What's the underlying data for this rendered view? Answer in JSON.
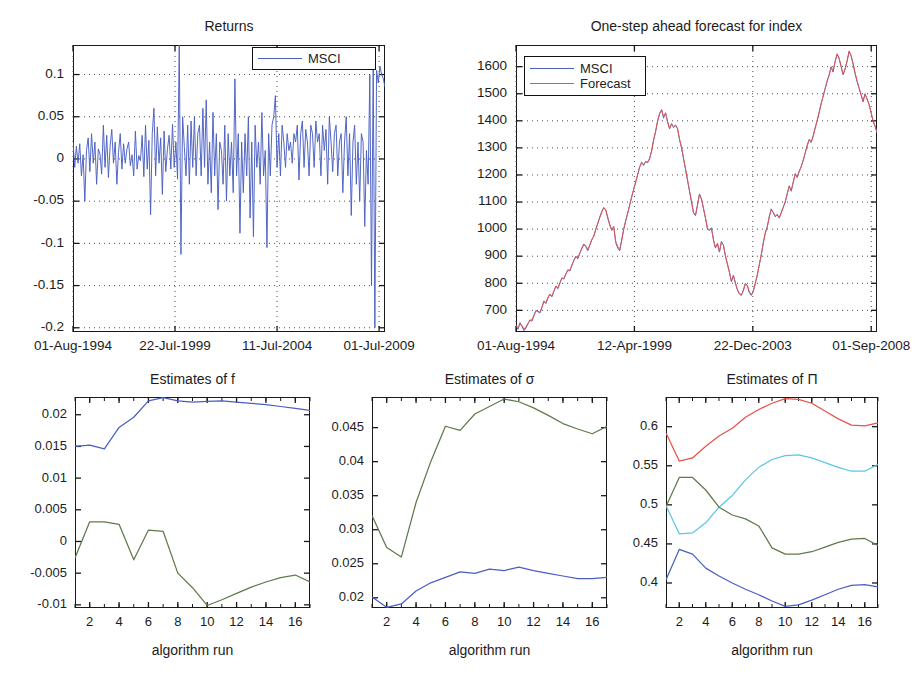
{
  "figure": {
    "background": "#ffffff",
    "colors": {
      "blue": "#4a5fc1",
      "red": "#e8534a",
      "green": "#5e7a4a",
      "cyan": "#58c8e8",
      "axis": "#1a1a1a",
      "grid": "#4d4d4d"
    }
  },
  "chart_data": [
    {
      "id": "returns",
      "type": "line",
      "title": "Returns",
      "xlabel": "",
      "ylabel": "",
      "grid": true,
      "legend": {
        "position": "top-right",
        "entries": [
          {
            "name": "MSCI",
            "color": "#4a5fc1"
          }
        ]
      },
      "xlim": [
        0,
        1
      ],
      "ylim": [
        -0.205,
        0.135
      ],
      "yticks": [
        0.1,
        0.05,
        0,
        -0.05,
        -0.1,
        -0.15,
        -0.2
      ],
      "ytick_labels": [
        "0.1",
        "0.05",
        "0",
        "-0.05",
        "-0.1",
        "-0.15",
        "-0.2"
      ],
      "xticks": [
        0.0,
        0.327,
        0.654,
        0.981
      ],
      "xtick_labels": [
        "01-Aug-1994",
        "22-Jul-1999",
        "11-Jul-2004",
        "01-Jul-2009"
      ],
      "series": [
        {
          "name": "MSCI",
          "color": "#4a5fc1",
          "values": [
            0.02,
            -0.01,
            0.015,
            -0.005,
            0.018,
            -0.02,
            0.005,
            -0.05,
            0.01,
            0.025,
            -0.015,
            0.03,
            -0.005,
            0.02,
            -0.03,
            0.012,
            0.006,
            -0.018,
            0.04,
            -0.01,
            0.028,
            -0.022,
            0.015,
            0.035,
            -0.005,
            0.02,
            -0.03,
            0.008,
            0.03,
            -0.012,
            0.018,
            -0.005,
            0.012,
            0.02,
            -0.008,
            0.005,
            -0.02,
            0.033,
            -0.012,
            0.004,
            -0.002,
            0.028,
            -0.021,
            0.04,
            -0.012,
            0.022,
            -0.066,
            0.03,
            0.06,
            -0.02,
            0.038,
            -0.005,
            0.025,
            -0.042,
            0.033,
            -0.015,
            0.012,
            0.028,
            -0.012,
            0.041,
            -0.01,
            0.02,
            -0.024,
            0.135,
            -0.113,
            0.05,
            0.015,
            -0.02,
            0.04,
            -0.03,
            0.045,
            -0.01,
            0.05,
            -0.02,
            0.03,
            0.04,
            -0.02,
            0.06,
            -0.01,
            0.07,
            -0.03,
            0.02,
            -0.04,
            0.055,
            -0.02,
            0.03,
            -0.06,
            0.02,
            0.01,
            -0.03,
            0.04,
            -0.05,
            0.03,
            -0.02,
            0.02,
            -0.04,
            0.095,
            -0.02,
            0.03,
            -0.088,
            0.02,
            -0.04,
            0.03,
            -0.02,
            0.05,
            -0.07,
            0.02,
            -0.092,
            0.04,
            -0.01,
            0.02,
            -0.03,
            0.055,
            -0.02,
            0.01,
            -0.105,
            0.03,
            -0.02,
            0.04,
            0.05,
            0.075,
            -0.01,
            0.03,
            -0.02,
            0.04,
            0.02,
            -0.01,
            0.03,
            0.01,
            0.02,
            -0.005,
            0.03,
            0.02,
            0.04,
            -0.025,
            0.03,
            0.045,
            -0.01,
            0.035,
            0.02,
            -0.02,
            0.04,
            0.03,
            -0.01,
            0.045,
            0.02,
            0.03,
            -0.02,
            0.04,
            0.01,
            0.035,
            -0.03,
            0.05,
            0.02,
            -0.015,
            0.03,
            0.04,
            -0.02,
            0.02,
            0.03,
            -0.04,
            0.02,
            0.05,
            -0.02,
            0.03,
            -0.067,
            0.02,
            0.04,
            -0.03,
            0.02,
            -0.05,
            0.03,
            0.02,
            -0.08,
            0.01,
            -0.03,
            0.1,
            -0.15,
            0.11,
            -0.2,
            0.105,
            0.09,
            0.11,
            0.1,
            0.095,
            0.085
          ]
        }
      ]
    },
    {
      "id": "forecast",
      "type": "line",
      "title": "One-step ahead forecast for index",
      "xlabel": "",
      "ylabel": "",
      "grid": true,
      "legend": {
        "position": "top-left",
        "entries": [
          {
            "name": "MSCI",
            "color": "#4a5fc1"
          },
          {
            "name": "Forecast",
            "color": "#e8534a"
          }
        ]
      },
      "xlim": [
        0,
        1
      ],
      "ylim": [
        620,
        1680
      ],
      "yticks": [
        1600,
        1500,
        1400,
        1300,
        1200,
        1100,
        1000,
        900,
        800,
        700
      ],
      "ytick_labels": [
        "1600",
        "1500",
        "1400",
        "1300",
        "1200",
        "1100",
        "1000",
        "900",
        "800",
        "700"
      ],
      "xticks": [
        0.0,
        0.328,
        0.656,
        0.984
      ],
      "xtick_labels": [
        "01-Aug-1994",
        "12-Apr-1999",
        "22-Dec-2003",
        "01-Sep-2008"
      ],
      "series": [
        {
          "name": "MSCI",
          "color": "#4a5fc1",
          "values": [
            640,
            630,
            655,
            640,
            625,
            635,
            650,
            665,
            660,
            680,
            700,
            695,
            690,
            710,
            735,
            725,
            745,
            760,
            750,
            770,
            790,
            780,
            800,
            820,
            815,
            835,
            850,
            845,
            865,
            885,
            900,
            890,
            910,
            930,
            945,
            935,
            920,
            940,
            960,
            975,
            1000,
            1020,
            1045,
            1065,
            1080,
            1070,
            1040,
            1015,
            995,
            1010,
            950,
            930,
            920,
            960,
            1000,
            1030,
            1060,
            1090,
            1120,
            1145,
            1175,
            1200,
            1230,
            1245,
            1235,
            1250,
            1245,
            1260,
            1290,
            1330,
            1360,
            1400,
            1425,
            1440,
            1410,
            1430,
            1395,
            1370,
            1390,
            1375,
            1385,
            1370,
            1330,
            1300,
            1260,
            1220,
            1180,
            1140,
            1100,
            1060,
            1050,
            1090,
            1130,
            1110,
            1075,
            1040,
            1000,
            995,
            1005,
            960,
            930,
            945,
            915,
            955,
            940,
            900,
            870,
            840,
            805,
            830,
            800,
            775,
            760,
            755,
            775,
            800,
            790,
            765,
            755,
            770,
            800,
            830,
            870,
            905,
            950,
            985,
            1010,
            1045,
            1075,
            1060,
            1045,
            1055,
            1040,
            1060,
            1080,
            1100,
            1130,
            1160,
            1140,
            1175,
            1205,
            1190,
            1215,
            1230,
            1255,
            1280,
            1310,
            1330,
            1320,
            1345,
            1375,
            1400,
            1430,
            1465,
            1490,
            1520,
            1545,
            1570,
            1600,
            1580,
            1620,
            1645,
            1630,
            1600,
            1570,
            1590,
            1620,
            1655,
            1640,
            1610,
            1575,
            1545,
            1520,
            1495,
            1470,
            1500,
            1480,
            1460,
            1430,
            1400,
            1380,
            1355
          ]
        },
        {
          "name": "Forecast",
          "color": "#e8534a",
          "values": [
            645,
            635,
            650,
            645,
            630,
            640,
            652,
            662,
            665,
            682,
            698,
            697,
            693,
            712,
            732,
            728,
            748,
            758,
            753,
            772,
            788,
            783,
            803,
            818,
            818,
            833,
            848,
            848,
            868,
            883,
            898,
            893,
            912,
            928,
            943,
            938,
            925,
            942,
            962,
            973,
            998,
            1022,
            1042,
            1062,
            1078,
            1072,
            1045,
            1018,
            998,
            1008,
            955,
            935,
            925,
            958,
            998,
            1032,
            1058,
            1088,
            1118,
            1148,
            1172,
            1202,
            1228,
            1248,
            1238,
            1248,
            1248,
            1262,
            1288,
            1328,
            1362,
            1398,
            1428,
            1442,
            1415,
            1428,
            1398,
            1372,
            1388,
            1378,
            1382,
            1372,
            1332,
            1302,
            1262,
            1222,
            1182,
            1142,
            1102,
            1062,
            1052,
            1088,
            1128,
            1112,
            1078,
            1042,
            1002,
            998,
            1002,
            962,
            932,
            948,
            918,
            952,
            942,
            902,
            872,
            842,
            808,
            828,
            802,
            778,
            762,
            758,
            772,
            798,
            792,
            768,
            758,
            772,
            802,
            832,
            868,
            908,
            948,
            988,
            1008,
            1048,
            1072,
            1062,
            1048,
            1052,
            1042,
            1062,
            1082,
            1102,
            1132,
            1158,
            1142,
            1172,
            1202,
            1192,
            1212,
            1232,
            1252,
            1282,
            1308,
            1332,
            1322,
            1342,
            1372,
            1402,
            1432,
            1462,
            1492,
            1518,
            1548,
            1568,
            1598,
            1582,
            1618,
            1648,
            1632,
            1602,
            1572,
            1592,
            1622,
            1658,
            1642,
            1612,
            1578,
            1548,
            1522,
            1498,
            1472,
            1498,
            1482,
            1462,
            1432,
            1402,
            1382,
            1358
          ]
        }
      ]
    },
    {
      "id": "estimates-f",
      "type": "line",
      "title": "Estimates of f",
      "xlabel": "algorithm run",
      "ylabel": "",
      "grid": false,
      "xlim": [
        1,
        17
      ],
      "ylim": [
        -0.0105,
        0.0228
      ],
      "yticks": [
        0.02,
        0.015,
        0.01,
        0.005,
        0,
        -0.005,
        -0.01
      ],
      "ytick_labels": [
        "0.02",
        "0.015",
        "0.01",
        "0.005",
        "0",
        "-0.005",
        "-0.01"
      ],
      "xticks": [
        2,
        4,
        6,
        8,
        10,
        12,
        14,
        16
      ],
      "xtick_labels": [
        "2",
        "4",
        "6",
        "8",
        "10",
        "12",
        "14",
        "16"
      ],
      "x": [
        1,
        2,
        3,
        4,
        5,
        6,
        7,
        8,
        9,
        10,
        11,
        12,
        13,
        14,
        15,
        16,
        17
      ],
      "series": [
        {
          "name": "regime-1",
          "color": "#4a5fc1",
          "values": [
            0.015,
            0.0152,
            0.0146,
            0.018,
            0.0196,
            0.0222,
            0.0227,
            0.0222,
            0.022,
            0.0221,
            0.0222,
            0.022,
            0.0218,
            0.0216,
            0.0213,
            0.021,
            0.0207
          ]
        },
        {
          "name": "regime-2",
          "color": "#5e7a4a",
          "values": [
            -0.0026,
            0.0031,
            0.0031,
            0.0027,
            -0.0029,
            0.0018,
            0.0016,
            -0.005,
            -0.0073,
            -0.0101,
            -0.0092,
            -0.0082,
            -0.0072,
            -0.0064,
            -0.0057,
            -0.0053,
            -0.0064
          ]
        }
      ]
    },
    {
      "id": "estimates-sigma",
      "type": "line",
      "title": "Estimates of σ",
      "xlabel": "algorithm run",
      "ylabel": "",
      "grid": false,
      "xlim": [
        1,
        17
      ],
      "ylim": [
        0.0185,
        0.0495
      ],
      "yticks": [
        0.045,
        0.04,
        0.035,
        0.03,
        0.025,
        0.02
      ],
      "ytick_labels": [
        "0.045",
        "0.04",
        "0.035",
        "0.03",
        "0.025",
        "0.02"
      ],
      "xticks": [
        2,
        4,
        6,
        8,
        10,
        12,
        14,
        16
      ],
      "xtick_labels": [
        "2",
        "4",
        "6",
        "8",
        "10",
        "12",
        "14",
        "16"
      ],
      "x": [
        1,
        2,
        3,
        4,
        5,
        6,
        7,
        8,
        9,
        10,
        11,
        12,
        13,
        14,
        15,
        16,
        17
      ],
      "series": [
        {
          "name": "regime-1",
          "color": "#5e7a4a",
          "values": [
            0.0321,
            0.0274,
            0.026,
            0.034,
            0.04,
            0.0452,
            0.0446,
            0.047,
            0.0481,
            0.0492,
            0.0488,
            0.0479,
            0.0468,
            0.0456,
            0.0448,
            0.0441,
            0.0452
          ]
        },
        {
          "name": "regime-2",
          "color": "#4a5fc1",
          "values": [
            0.0201,
            0.0186,
            0.0191,
            0.021,
            0.0222,
            0.023,
            0.0238,
            0.0236,
            0.0242,
            0.024,
            0.0245,
            0.024,
            0.0236,
            0.0232,
            0.0228,
            0.0228,
            0.023
          ]
        }
      ]
    },
    {
      "id": "estimates-pi",
      "type": "line",
      "title": "Estimates of Π",
      "xlabel": "algorithm run",
      "ylabel": "",
      "grid": false,
      "xlim": [
        1,
        17
      ],
      "ylim": [
        0.368,
        0.638
      ],
      "yticks": [
        0.6,
        0.55,
        0.5,
        0.45,
        0.4
      ],
      "ytick_labels": [
        "0.6",
        "0.55",
        "0.5",
        "0.45",
        "0.4"
      ],
      "xticks": [
        2,
        4,
        6,
        8,
        10,
        12,
        14,
        16
      ],
      "xtick_labels": [
        "2",
        "4",
        "6",
        "8",
        "10",
        "12",
        "14",
        "16"
      ],
      "x": [
        1,
        2,
        3,
        4,
        5,
        6,
        7,
        8,
        9,
        10,
        11,
        12,
        13,
        14,
        15,
        16,
        17
      ],
      "series": [
        {
          "name": "pi-11",
          "color": "#e8534a",
          "values": [
            0.592,
            0.556,
            0.56,
            0.575,
            0.588,
            0.598,
            0.612,
            0.622,
            0.63,
            0.636,
            0.635,
            0.63,
            0.62,
            0.61,
            0.602,
            0.601,
            0.605
          ]
        },
        {
          "name": "pi-12",
          "color": "#58c8e8",
          "values": [
            0.499,
            0.463,
            0.464,
            0.477,
            0.497,
            0.512,
            0.532,
            0.548,
            0.558,
            0.563,
            0.564,
            0.56,
            0.554,
            0.548,
            0.543,
            0.543,
            0.552
          ]
        },
        {
          "name": "pi-21",
          "color": "#5e7a4a",
          "values": [
            0.498,
            0.535,
            0.535,
            0.519,
            0.497,
            0.487,
            0.482,
            0.473,
            0.445,
            0.437,
            0.437,
            0.44,
            0.446,
            0.452,
            0.456,
            0.457,
            0.448
          ]
        },
        {
          "name": "pi-22",
          "color": "#4a5fc1",
          "values": [
            0.404,
            0.443,
            0.437,
            0.419,
            0.409,
            0.4,
            0.392,
            0.385,
            0.377,
            0.37,
            0.372,
            0.378,
            0.385,
            0.392,
            0.397,
            0.398,
            0.395
          ]
        }
      ]
    }
  ]
}
